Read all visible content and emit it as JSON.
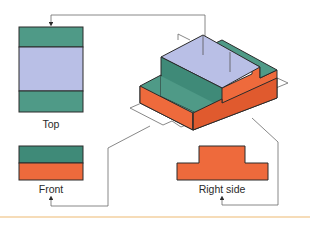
{
  "colors": {
    "teal": "#4f9a87",
    "teal_dark": "#3f8a78",
    "lavender": "#b9bfe6",
    "orange": "#ee6a3c",
    "orange_dark": "#e05a2e",
    "outline": "#2b2b2b",
    "leader_line": "#6a6a6a",
    "rule": "#f6dcb8"
  },
  "views": {
    "top": {
      "label": "Top"
    },
    "front": {
      "label": "Front"
    },
    "right": {
      "label": "Right side"
    }
  },
  "object": {
    "name": "isometric-stepped-block"
  }
}
